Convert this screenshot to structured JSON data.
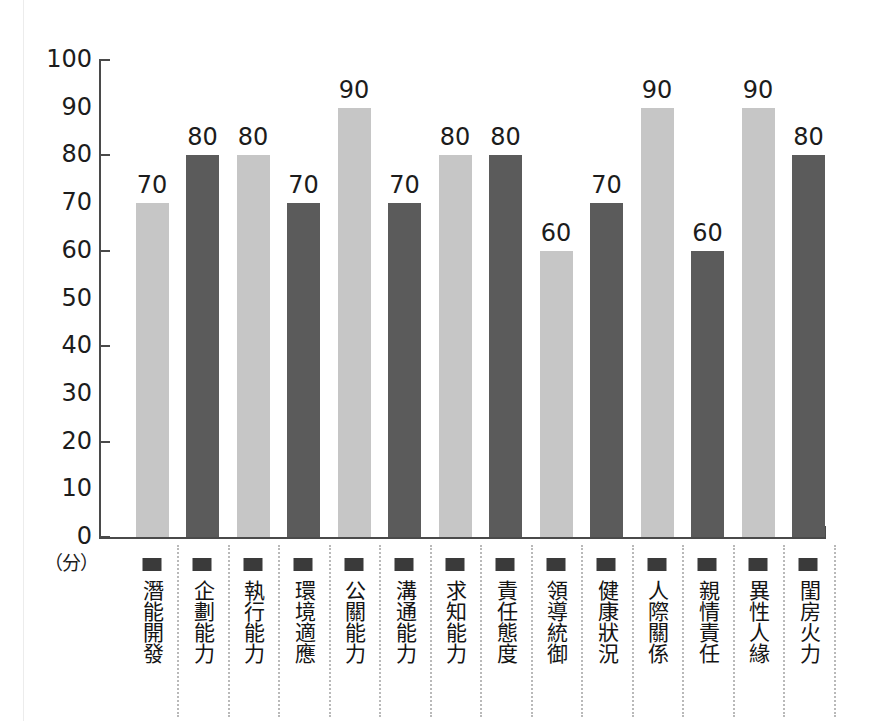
{
  "chart_data": {
    "type": "bar",
    "title": "",
    "xlabel": "",
    "ylabel": "",
    "unit_label": "（分）",
    "ylim": [
      0,
      100
    ],
    "y_ticks": [
      0,
      10,
      20,
      30,
      40,
      50,
      60,
      70,
      80,
      90,
      100
    ],
    "y_tick_marks": [
      0,
      20,
      40,
      60,
      80,
      100
    ],
    "grid": false,
    "legend": "none",
    "categories": [
      "潛能開發",
      "企劃能力",
      "執行能力",
      "環境適應",
      "公關能力",
      "溝通能力",
      "求知能力",
      "責任態度",
      "領導統御",
      "健康狀況",
      "人際關係",
      "親情責任",
      "異性人緣",
      "閨房火力"
    ],
    "values": [
      70,
      80,
      80,
      70,
      90,
      70,
      80,
      80,
      60,
      70,
      90,
      60,
      90,
      80
    ],
    "bar_colors": [
      "#c6c6c6",
      "#5b5b5b",
      "#c6c6c6",
      "#5b5b5b",
      "#c6c6c6",
      "#5b5b5b",
      "#c6c6c6",
      "#5b5b5b",
      "#c6c6c6",
      "#5b5b5b",
      "#c6c6c6",
      "#5b5b5b",
      "#c6c6c6",
      "#5b5b5b"
    ],
    "bar_data": [
      {
        "category": "潛能開發",
        "value": 70,
        "color": "#c6c6c6",
        "tone": "light"
      },
      {
        "category": "企劃能力",
        "value": 80,
        "color": "#5b5b5b",
        "tone": "dark"
      },
      {
        "category": "執行能力",
        "value": 80,
        "color": "#c6c6c6",
        "tone": "light"
      },
      {
        "category": "環境適應",
        "value": 70,
        "color": "#5b5b5b",
        "tone": "dark"
      },
      {
        "category": "公關能力",
        "value": 90,
        "color": "#c6c6c6",
        "tone": "light"
      },
      {
        "category": "溝通能力",
        "value": 70,
        "color": "#5b5b5b",
        "tone": "dark"
      },
      {
        "category": "求知能力",
        "value": 80,
        "color": "#c6c6c6",
        "tone": "light"
      },
      {
        "category": "責任態度",
        "value": 80,
        "color": "#5b5b5b",
        "tone": "dark"
      },
      {
        "category": "領導統御",
        "value": 60,
        "color": "#c6c6c6",
        "tone": "light"
      },
      {
        "category": "健康狀況",
        "value": 70,
        "color": "#5b5b5b",
        "tone": "dark"
      },
      {
        "category": "人際關係",
        "value": 90,
        "color": "#c6c6c6",
        "tone": "light"
      },
      {
        "category": "親情責任",
        "value": 60,
        "color": "#5b5b5b",
        "tone": "dark"
      },
      {
        "category": "異性人緣",
        "value": 90,
        "color": "#c6c6c6",
        "tone": "light"
      },
      {
        "category": "閨房火力",
        "value": 80,
        "color": "#5b5b5b",
        "tone": "dark"
      }
    ]
  },
  "colors": {
    "axis": "#4a4a4a",
    "text": "#1c1c1c",
    "marker": "#3a3a3a",
    "divider": "#b9b9b9",
    "bar_light": "#c6c6c6",
    "bar_dark": "#5b5b5b",
    "background": "#ffffff"
  }
}
